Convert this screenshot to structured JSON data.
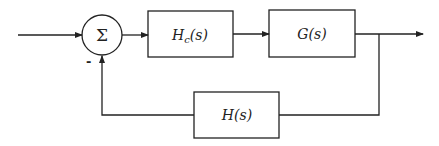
{
  "diagram": {
    "type": "feedback-control-block-diagram",
    "summing_junction": {
      "symbol": "Σ",
      "feedback_sign": "-"
    },
    "blocks": [
      {
        "id": "controller",
        "label_main": "H",
        "label_sub": "c",
        "label_tail": "(s)"
      },
      {
        "id": "plant",
        "label": "G(s)"
      },
      {
        "id": "feedback",
        "label": "H(s)"
      }
    ],
    "connections": [
      {
        "from": "input",
        "to": "summing_junction"
      },
      {
        "from": "summing_junction",
        "to": "controller"
      },
      {
        "from": "controller",
        "to": "plant"
      },
      {
        "from": "plant",
        "to": "output"
      },
      {
        "from": "plant",
        "to": "feedback"
      },
      {
        "from": "feedback",
        "to": "summing_junction",
        "sign": "-"
      }
    ],
    "colors": {
      "stroke": "#222222",
      "background": "#ffffff"
    }
  }
}
